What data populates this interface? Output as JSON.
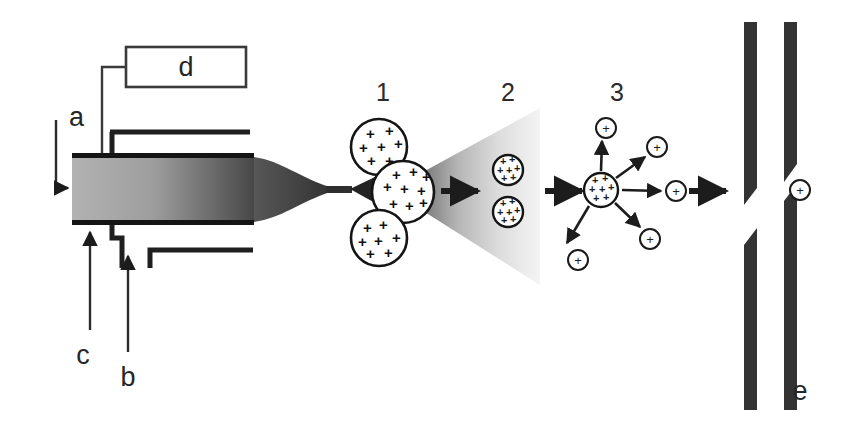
{
  "figure": {
    "background_color": "#ffffff",
    "width": 845,
    "height": 431
  },
  "labels": {
    "a": "a",
    "b": "b",
    "c": "c",
    "d": "d",
    "e": "e"
  },
  "stage_numbers": {
    "one": "1",
    "two": "2",
    "three": "3"
  },
  "symbols": {
    "plus": "+",
    "ion_plus": "+"
  },
  "colors": {
    "ink": "#262626",
    "line": "#3a3a3a",
    "capillary_light": "#a9a9a9",
    "capillary_dark": "#4a4a4a",
    "plume_dark": "#3d3d3d",
    "plume_light": "#f2f2f2",
    "electrode": "#333333",
    "droplet_fill": "#ffffff",
    "droplet_stroke": "#1a1a1a"
  },
  "droplets": {
    "stage1": [
      {
        "cx": 379,
        "cy": 147,
        "r": 28,
        "charges": 7
      },
      {
        "cx": 403,
        "cy": 192,
        "r": 31,
        "charges": 9
      },
      {
        "cx": 379,
        "cy": 238,
        "r": 28,
        "charges": 7
      }
    ],
    "stage2": [
      {
        "cx": 508,
        "cy": 170,
        "r": 15,
        "charges": 9
      },
      {
        "cx": 508,
        "cy": 212,
        "r": 15,
        "charges": 9
      }
    ],
    "stage3_parent": {
      "cx": 601,
      "cy": 190,
      "r": 17,
      "charges": 11
    }
  },
  "stage3_ions": [
    {
      "cx": 606,
      "cy": 128,
      "r": 10
    },
    {
      "cx": 657,
      "cy": 147,
      "r": 10
    },
    {
      "cx": 676,
      "cy": 191,
      "r": 10
    },
    {
      "cx": 650,
      "cy": 239,
      "r": 10
    },
    {
      "cx": 578,
      "cy": 260,
      "r": 10
    }
  ],
  "stage3_arrows": [
    {
      "x1": 601,
      "y1": 171,
      "x2": 603,
      "y2": 143
    },
    {
      "x1": 615,
      "y1": 178,
      "x2": 646,
      "y2": 156
    },
    {
      "x1": 622,
      "y1": 190,
      "x2": 662,
      "y2": 191
    },
    {
      "x1": 615,
      "y1": 203,
      "x2": 641,
      "y2": 228
    },
    {
      "x1": 588,
      "y1": 206,
      "x2": 566,
      "y2": 245
    }
  ],
  "transition_arrows": [
    {
      "x1": 441,
      "y1": 191,
      "x2": 482,
      "y2": 191
    },
    {
      "x1": 545,
      "y1": 191,
      "x2": 586,
      "y2": 191
    },
    {
      "x1": 687,
      "y1": 191,
      "x2": 728,
      "y2": 191
    }
  ],
  "final_ion": {
    "cx": 800,
    "cy": 190,
    "r": 10
  },
  "electrodes": [
    {
      "name": "plate-upper-left",
      "points": "744,22 757,22 757,188 744,205"
    },
    {
      "name": "plate-upper-right",
      "points": "784,22 797,22 797,164 784,182"
    },
    {
      "name": "plate-lower-left",
      "points": "744,245 757,228 757,410 744,410"
    },
    {
      "name": "plate-lower-right",
      "points": "784,201 797,184 797,410 784,410"
    }
  ]
}
